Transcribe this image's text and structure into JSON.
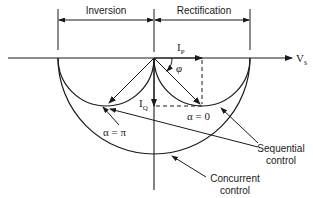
{
  "diagram": {
    "title_regions": {
      "inversion": "Inversion",
      "rectification": "Rectification"
    },
    "axes": {
      "horizontal_label": "V",
      "horizontal_subscript": "s",
      "active_current_label": "I",
      "active_current_subscript": "P",
      "reactive_current_label": "I",
      "reactive_current_subscript": "Q",
      "angle_label": "φ"
    },
    "annotations": {
      "alpha_pi": "α = π",
      "alpha_zero": "α = 0",
      "sequential_line1": "Sequential",
      "sequential_line2": "control",
      "concurrent_line1": "Concurrent",
      "concurrent_line2": "control"
    },
    "colors": {
      "line": "#1a1a1a",
      "background": "#ffffff"
    }
  }
}
